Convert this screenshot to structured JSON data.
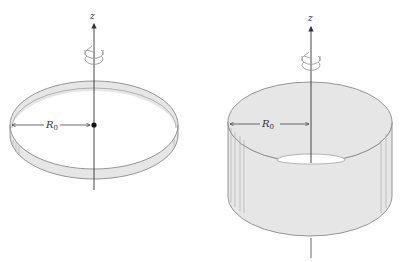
{
  "figure": {
    "panels": [
      {
        "id": "ring",
        "description": "Thin rotating ring of radius R0 about the z axis",
        "axis_label": "z",
        "radius_label": "R",
        "radius_subscript": "0",
        "rotation_indicator": "counterclockwise-rotation-arrow",
        "center_marker": "dot"
      },
      {
        "id": "cylinder",
        "description": "Rotating cylindrical shell of radius R0 about the z axis",
        "axis_label": "z",
        "radius_label": "R",
        "radius_subscript": "0",
        "rotation_indicator": "counterclockwise-rotation-arrow"
      }
    ],
    "colors": {
      "surface_fill": "#e6e6e6",
      "outline": "#8a8a8a",
      "axis": "#333333",
      "background": "#ffffff"
    }
  }
}
